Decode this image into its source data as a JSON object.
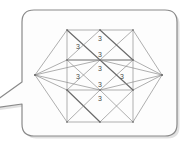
{
  "figure": {
    "type": "diagram",
    "title": "",
    "background_color": "#ffffff"
  },
  "callout": {
    "shape": "speech-bubble",
    "fill_color": "#fdfdfd",
    "border_color": "#8a8a8a",
    "shadow_color": "#c9c9c9",
    "tail_direction": "left",
    "corner_radius": 12
  },
  "graph": {
    "edge_color": "#8c8c8c",
    "edge_color_dark": "#6a6a6a",
    "label_color": "#4c4c4c",
    "label_text": "3",
    "vertices": [
      {
        "id": "L",
        "name": "left-apex",
        "x": 35,
        "y": 75
      },
      {
        "id": "R",
        "name": "right-apex",
        "x": 162,
        "y": 75
      },
      {
        "id": "A1",
        "name": "grid-row1-col1",
        "x": 67,
        "y": 30
      },
      {
        "id": "A2",
        "name": "grid-row1-col2",
        "x": 100,
        "y": 30
      },
      {
        "id": "A3",
        "name": "grid-row1-col3",
        "x": 133,
        "y": 30
      },
      {
        "id": "B1",
        "name": "grid-row2-col1",
        "x": 67,
        "y": 60
      },
      {
        "id": "B2",
        "name": "grid-row2-col2",
        "x": 100,
        "y": 60
      },
      {
        "id": "B3",
        "name": "grid-row2-col3",
        "x": 133,
        "y": 60
      },
      {
        "id": "C1",
        "name": "grid-row3-col1",
        "x": 67,
        "y": 90
      },
      {
        "id": "C2",
        "name": "grid-row3-col2",
        "x": 100,
        "y": 90
      },
      {
        "id": "C3",
        "name": "grid-row3-col3",
        "x": 133,
        "y": 90
      },
      {
        "id": "D1",
        "name": "grid-row4-col1",
        "x": 67,
        "y": 122
      },
      {
        "id": "D2",
        "name": "grid-row4-col2",
        "x": 100,
        "y": 122
      },
      {
        "id": "D3",
        "name": "grid-row4-col3",
        "x": 133,
        "y": 122
      }
    ],
    "edges": [
      {
        "from": "A1",
        "to": "A2",
        "weight": "thin"
      },
      {
        "from": "A2",
        "to": "A3",
        "weight": "thin"
      },
      {
        "from": "B1",
        "to": "B2",
        "weight": "bold"
      },
      {
        "from": "B2",
        "to": "B3",
        "weight": "bold"
      },
      {
        "from": "C1",
        "to": "C2",
        "weight": "thin"
      },
      {
        "from": "C2",
        "to": "C3",
        "weight": "thin"
      },
      {
        "from": "D1",
        "to": "D2",
        "weight": "thin"
      },
      {
        "from": "D2",
        "to": "D3",
        "weight": "thin"
      },
      {
        "from": "A1",
        "to": "B1",
        "weight": "thin"
      },
      {
        "from": "B1",
        "to": "C1",
        "weight": "thin"
      },
      {
        "from": "C1",
        "to": "D1",
        "weight": "thin"
      },
      {
        "from": "A3",
        "to": "B3",
        "weight": "thin"
      },
      {
        "from": "B3",
        "to": "C3",
        "weight": "thin"
      },
      {
        "from": "C3",
        "to": "D3",
        "weight": "thin"
      },
      {
        "from": "A1",
        "to": "B2",
        "weight": "bold"
      },
      {
        "from": "B2",
        "to": "A3",
        "weight": "thin"
      },
      {
        "from": "A2",
        "to": "B1",
        "weight": "thin"
      },
      {
        "from": "A2",
        "to": "B3",
        "weight": "bold"
      },
      {
        "from": "B1",
        "to": "C2",
        "weight": "thin"
      },
      {
        "from": "C2",
        "to": "B3",
        "weight": "thin"
      },
      {
        "from": "B2",
        "to": "C1",
        "weight": "thin"
      },
      {
        "from": "B2",
        "to": "C3",
        "weight": "bold"
      },
      {
        "from": "C1",
        "to": "D2",
        "weight": "bold"
      },
      {
        "from": "D2",
        "to": "C3",
        "weight": "thin"
      },
      {
        "from": "C2",
        "to": "D1",
        "weight": "thin"
      },
      {
        "from": "C2",
        "to": "D3",
        "weight": "thin"
      },
      {
        "from": "L",
        "to": "A1",
        "weight": "thin"
      },
      {
        "from": "L",
        "to": "B1",
        "weight": "thin"
      },
      {
        "from": "L",
        "to": "C1",
        "weight": "thin"
      },
      {
        "from": "L",
        "to": "D1",
        "weight": "thin"
      },
      {
        "from": "L",
        "to": "B2",
        "weight": "thin"
      },
      {
        "from": "L",
        "to": "C2",
        "weight": "thin"
      },
      {
        "from": "R",
        "to": "A3",
        "weight": "thin"
      },
      {
        "from": "R",
        "to": "B3",
        "weight": "thin"
      },
      {
        "from": "R",
        "to": "C3",
        "weight": "thin"
      },
      {
        "from": "R",
        "to": "D3",
        "weight": "thin"
      },
      {
        "from": "R",
        "to": "B2",
        "weight": "thin"
      },
      {
        "from": "R",
        "to": "C2",
        "weight": "thin"
      }
    ],
    "labels": [
      {
        "id": "lbl-top-center",
        "text": "3",
        "x": 100,
        "y": 38
      },
      {
        "id": "lbl-upper-left",
        "text": "3",
        "x": 78,
        "y": 46
      },
      {
        "id": "lbl-upper-mid",
        "text": "3",
        "x": 100,
        "y": 54
      },
      {
        "id": "lbl-mid-top",
        "text": "3",
        "x": 100,
        "y": 68
      },
      {
        "id": "lbl-mid-left",
        "text": "3",
        "x": 78,
        "y": 76
      },
      {
        "id": "lbl-mid-right",
        "text": "3",
        "x": 122,
        "y": 76
      },
      {
        "id": "lbl-mid-bottom",
        "text": "3",
        "x": 100,
        "y": 84
      },
      {
        "id": "lbl-lower-center",
        "text": "3",
        "x": 100,
        "y": 98
      }
    ]
  }
}
